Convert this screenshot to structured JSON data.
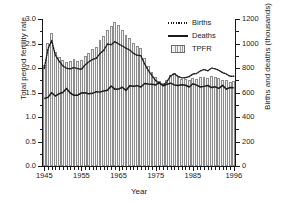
{
  "chart_data": {
    "type": "bar",
    "title": "",
    "subtitle": "",
    "xlabel": "Year",
    "ylabel": "Total period fertility rate",
    "ylabel_right": "Births and deaths (thousands)",
    "xlim": [
      1944.4,
      1996.6
    ],
    "ylim": [
      0.0,
      3.0
    ],
    "ylim_right": [
      0,
      1200
    ],
    "grid": false,
    "legend_position": "top-right",
    "x_ticks": [
      1945,
      1955,
      1965,
      1975,
      1985,
      1996
    ],
    "x_tick_labels": [
      "1945",
      "1955",
      "1965",
      "1975",
      "1985",
      "1996"
    ],
    "y_ticks_left": [
      0.0,
      0.5,
      1.0,
      1.5,
      2.0,
      2.5,
      3.0
    ],
    "y_tick_labels_left": [
      "0.0",
      "0.5",
      "1.0",
      "1.5",
      "2.0",
      "2.5",
      "3.0"
    ],
    "y_ticks_right": [
      0,
      200,
      400,
      600,
      800,
      1000,
      1200
    ],
    "y_tick_labels_right": [
      "0",
      "200",
      "400",
      "600",
      "800",
      "1000",
      "1200"
    ],
    "x": [
      1945,
      1946,
      1947,
      1948,
      1949,
      1950,
      1951,
      1952,
      1953,
      1954,
      1955,
      1956,
      1957,
      1958,
      1959,
      1960,
      1961,
      1962,
      1963,
      1964,
      1965,
      1966,
      1967,
      1968,
      1969,
      1970,
      1971,
      1972,
      1973,
      1974,
      1975,
      1976,
      1977,
      1978,
      1979,
      1980,
      1981,
      1982,
      1983,
      1984,
      1985,
      1986,
      1987,
      1988,
      1989,
      1990,
      1991,
      1992,
      1993,
      1994,
      1995,
      1996
    ],
    "series": [
      {
        "name": "TPFR",
        "axis": "left",
        "style": "bar",
        "units": "children per woman",
        "values": [
          2.06,
          2.52,
          2.72,
          2.32,
          2.22,
          2.17,
          2.13,
          2.15,
          2.18,
          2.15,
          2.17,
          2.25,
          2.31,
          2.38,
          2.42,
          2.57,
          2.65,
          2.78,
          2.85,
          2.93,
          2.88,
          2.78,
          2.68,
          2.61,
          2.51,
          2.44,
          2.4,
          2.2,
          2.04,
          1.92,
          1.81,
          1.74,
          1.69,
          1.76,
          1.86,
          1.9,
          1.81,
          1.78,
          1.77,
          1.75,
          1.79,
          1.78,
          1.82,
          1.82,
          1.8,
          1.84,
          1.82,
          1.8,
          1.76,
          1.75,
          1.71,
          1.73
        ]
      },
      {
        "name": "Births",
        "axis": "right",
        "style": "dotted-line",
        "units": "thousands",
        "values": [
          796,
          955,
          1025,
          905,
          856,
          818,
          797,
          793,
          804,
          795,
          789,
          825,
          851,
          870,
          880,
          918,
          944,
          996,
          990,
          1015,
          997,
          980,
          962,
          947,
          920,
          904,
          902,
          834,
          780,
          737,
          698,
          675,
          657,
          687,
          735,
          754,
          731,
          719,
          721,
          730,
          751,
          755,
          776,
          788,
          777,
          799,
          793,
          781,
          762,
          751,
          732,
          733
        ]
      },
      {
        "name": "Deaths",
        "axis": "right",
        "style": "solid-line",
        "units": "thousands",
        "values": [
          551,
          560,
          598,
          571,
          590,
          600,
          632,
          596,
          577,
          578,
          596,
          598,
          589,
          593,
          607,
          603,
          613,
          619,
          653,
          627,
          628,
          643,
          617,
          655,
          651,
          656,
          645,
          674,
          670,
          667,
          662,
          681,
          655,
          667,
          676,
          662,
          658,
          663,
          659,
          645,
          671,
          660,
          645,
          650,
          657,
          641,
          646,
          634,
          658,
          627,
          641,
          639
        ]
      }
    ]
  },
  "legend": {
    "entries": [
      {
        "label": "Births",
        "key": "dotted-line"
      },
      {
        "label": "Deaths",
        "key": "solid-line"
      },
      {
        "label": "TPFR",
        "key": "hatched-swatch"
      }
    ]
  },
  "colors": {
    "axis": "#1a1a1a",
    "bar_fill": "#f2f2f2",
    "bar_hatch": "#9a9a9a",
    "bar_edge": "#8c8c8c",
    "line": "#1a1a1a",
    "background": "#ffffff"
  }
}
